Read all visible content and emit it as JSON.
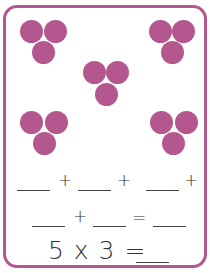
{
  "worksheet": {
    "accent_color": "#b5578f",
    "groups": [
      {
        "name": "top-left",
        "count": 3
      },
      {
        "name": "top-right",
        "count": 3
      },
      {
        "name": "center",
        "count": 3
      },
      {
        "name": "bottom-left",
        "count": 3
      },
      {
        "name": "bottom-right",
        "count": 3
      }
    ],
    "row1": {
      "op1": "+",
      "op2": "+",
      "op3": "+"
    },
    "row2": {
      "op1": "+",
      "op2": "="
    },
    "row3": {
      "expression": "5 x 3 ="
    }
  }
}
